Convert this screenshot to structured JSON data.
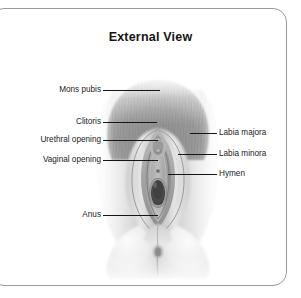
{
  "figure": {
    "title": "External View",
    "type": "anatomical-illustration",
    "style": "grayscale medical illustration",
    "border_color": "#9a9a9a",
    "text_color": "#1b1b1b",
    "leader_color": "#151515",
    "background": "#ffffff"
  },
  "labels": {
    "left": [
      {
        "text": "Mons pubis",
        "name": "mons-pubis"
      },
      {
        "text": "Clitoris",
        "name": "clitoris"
      },
      {
        "text": "Urethral opening",
        "name": "urethral-opening"
      },
      {
        "text": "Vaginal opening",
        "name": "vaginal-opening"
      },
      {
        "text": "Anus",
        "name": "anus"
      }
    ],
    "right": [
      {
        "text": "Labia majora",
        "name": "labia-majora"
      },
      {
        "text": "Labia minora",
        "name": "labia-minora"
      },
      {
        "text": "Hymen",
        "name": "hymen"
      }
    ]
  }
}
